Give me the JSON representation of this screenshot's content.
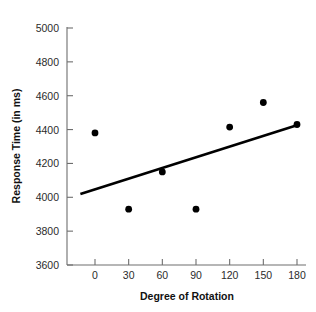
{
  "chart_data": {
    "type": "scatter",
    "title": "",
    "xlabel": "Degree of Rotation",
    "ylabel": "Response Time (in ms)",
    "x": [
      0,
      30,
      60,
      90,
      120,
      150,
      180
    ],
    "values": [
      4380,
      3930,
      4150,
      3930,
      4415,
      4560,
      4430
    ],
    "series": [
      {
        "name": "Response Time",
        "points": [
          {
            "x": 0,
            "y": 4380
          },
          {
            "x": 30,
            "y": 3930
          },
          {
            "x": 60,
            "y": 4150
          },
          {
            "x": 90,
            "y": 3930
          },
          {
            "x": 120,
            "y": 4415
          },
          {
            "x": 150,
            "y": 4560
          },
          {
            "x": 180,
            "y": 4430
          }
        ]
      }
    ],
    "trend_line": {
      "name": "best-fit line",
      "x_start": -13,
      "y_start": 4020,
      "x_end": 182,
      "y_end": 4430
    },
    "xlim": [
      -13,
      182
    ],
    "ylim": [
      3600,
      5000
    ],
    "xticks": [
      0,
      30,
      60,
      90,
      120,
      150,
      180
    ],
    "xtick_labels": [
      "0",
      "30",
      "60",
      "90",
      "120",
      "150",
      "180"
    ],
    "yticks": [
      3600,
      3800,
      4000,
      4200,
      4400,
      4600,
      4800,
      5000
    ],
    "ytick_labels": [
      "3600",
      "3800",
      "4000",
      "4200",
      "4400",
      "4600",
      "4800",
      "5000"
    ],
    "grid": false,
    "legend": "none",
    "marker_color": "#000000",
    "line_color": "#000000",
    "axis_color": "#6e6e6e",
    "background_color": "#ffffff"
  }
}
